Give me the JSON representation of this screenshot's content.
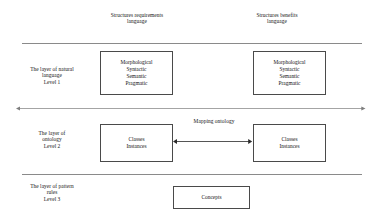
{
  "diagram": {
    "background_color": "#ffffff",
    "line_color": "#8a8a8a",
    "box_border_color": "#4a4a4a",
    "text_color": "#151515",
    "columns": [
      {
        "id": "requirements",
        "caption": "Structures requirements\nlanguage"
      },
      {
        "id": "benefits",
        "caption": "Structures benefits\nlanguage"
      }
    ],
    "layers": [
      {
        "id": "level-1",
        "caption": "The layer of natural\nlanguage\nLevel 1",
        "left_box": "Morphological\nSyntactic\nSemantic\nPragmatic",
        "right_box": "Morphological\nSyntactic\nSemantic\nPragmatic"
      },
      {
        "id": "level-2",
        "caption": "The layer of\nontology\nLevel 2",
        "left_box": "Classes\nInstances",
        "right_box": "Classes\nInstances"
      },
      {
        "id": "level-3",
        "caption": "The layer of pattern\nrules\nLevel 3",
        "center_box": "Concepts"
      }
    ],
    "connectors": [
      {
        "id": "mapping-ontology",
        "label": "Mapping ontology",
        "style": "double-headed-arrow",
        "between": [
          "level-2-left-box",
          "level-2-right-box"
        ]
      },
      {
        "id": "layer-axis",
        "label": "",
        "style": "double-headed-arrow",
        "between": [
          "left-edge",
          "right-edge"
        ]
      }
    ],
    "dividers": [
      {
        "id": "divider-top",
        "style": "solid-line"
      },
      {
        "id": "divider-bottom",
        "style": "solid-line"
      }
    ]
  }
}
